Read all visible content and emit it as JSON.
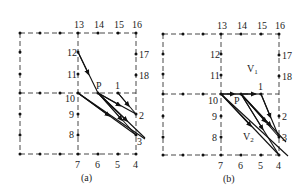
{
  "figure": {
    "panels": [
      {
        "caption": "(a)",
        "origin": [
          20,
          33
        ],
        "col_x": [
          0,
          20,
          40,
          58,
          78,
          98,
          116
        ],
        "row_y": [
          0,
          20,
          41,
          60,
          81,
          101,
          121
        ],
        "labels": {
          "13": "13",
          "14": "14",
          "15": "15",
          "16": "16",
          "17": "17",
          "18": "18",
          "1": "1",
          "2": "2",
          "3": "3",
          "4": "4",
          "5": "5",
          "6": "6",
          "7": "7",
          "8": "8",
          "9": "9",
          "10": "10",
          "11": "11",
          "12": "12",
          "P": "P"
        }
      },
      {
        "caption": "(b)",
        "origin": [
          163,
          34
        ],
        "col_x": [
          0,
          20,
          40,
          58,
          78,
          98,
          116
        ],
        "row_y": [
          0,
          20,
          40,
          60,
          81,
          102,
          121
        ],
        "labels": {
          "13": "13",
          "14": "14",
          "15": "15",
          "16": "16",
          "17": "17",
          "18": "18",
          "1": "1",
          "2": "2",
          "3": "3",
          "4": "4",
          "5": "5",
          "6": "6",
          "7": "7",
          "8": "8",
          "9": "9",
          "10": "10",
          "11": "11",
          "12": "12",
          "P": "P",
          "V1": "V",
          "V1_sub": "1",
          "V2": "V",
          "V2_sub": "2"
        }
      }
    ]
  }
}
